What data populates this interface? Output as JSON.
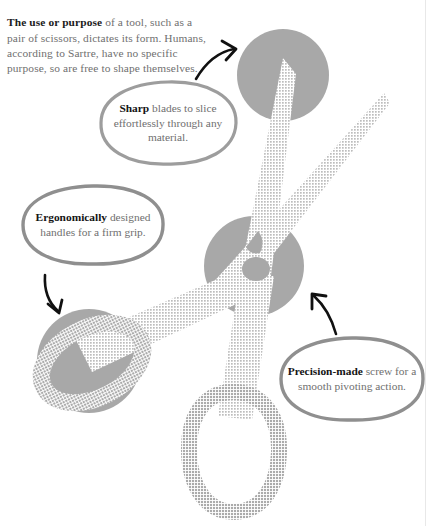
{
  "page": {
    "background_color": "#ffffff",
    "rule_color": "#e8e8e8"
  },
  "intro": {
    "lead": "The use or purpose",
    "body": " of a tool, such as a pair of scissors, dictates its form. Humans, according to Sartre, have no specific purpose, so are free to shape themselves."
  },
  "callouts": [
    {
      "id": "sharp",
      "lead": "Sharp",
      "body": " blades to slice effortlessly through any material.",
      "outline_color": "#9d9d9d"
    },
    {
      "id": "ergonomic",
      "lead": "Ergonomically",
      "body": " designed handles for a firm grip.",
      "outline_color": "#8f8f8f"
    },
    {
      "id": "precision",
      "lead": "Precision-made",
      "body": " screw for a smooth pivoting action.",
      "outline_color": "#8f8f8f"
    }
  ],
  "illustration": {
    "name": "scissors",
    "solid_gray": "#a8a8a8",
    "halftone_gray": "#b4b4b4",
    "arrow_color": "#111111",
    "parts": [
      "upper-blade-circle",
      "pivot-circle",
      "left-handle-circle",
      "upper-left-blade",
      "upper-right-blade",
      "left-handle-loop",
      "bottom-handle-loop",
      "pivot-screw"
    ],
    "arrows": [
      "arrow-to-blade",
      "arrow-to-handle",
      "arrow-to-screw"
    ]
  }
}
